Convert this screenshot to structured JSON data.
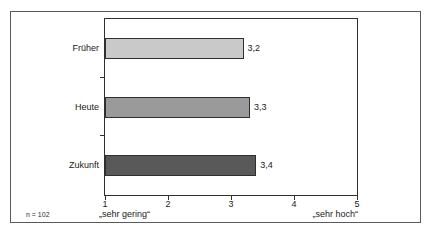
{
  "chart_data": {
    "type": "bar",
    "orientation": "horizontal",
    "categories": [
      "Früher",
      "Heute",
      "Zukunft"
    ],
    "values": [
      3.2,
      3.3,
      3.4
    ],
    "value_labels": [
      "3,2",
      "3,3",
      "3,4"
    ],
    "bar_colors": [
      "#c9c9c9",
      "#9a9a9a",
      "#595959"
    ],
    "bar_border_color": "#2f2f2f",
    "xlim": [
      1,
      5
    ],
    "x_ticks": [
      1,
      2,
      3,
      4,
      5
    ],
    "x_tick_labels": [
      "1",
      "2",
      "3",
      "4",
      "5"
    ],
    "axis_min_label": "„sehr gering“",
    "axis_max_label": "„sehr hoch“",
    "footnote": "n = 102",
    "title": "",
    "xlabel": "",
    "ylabel": "",
    "grid": false,
    "legend": "none"
  }
}
